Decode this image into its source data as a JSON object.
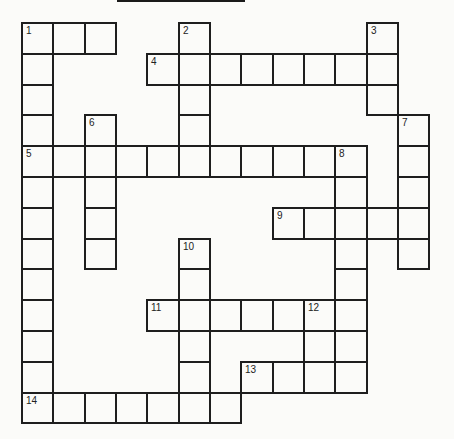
{
  "puzzle": {
    "title_bar": true,
    "grid": {
      "origin_x": 21,
      "origin_y": 22,
      "cell_w": 31.33,
      "cell_h": 30.8,
      "cols": 13,
      "rows": 13,
      "line_color": "#1e1e1e",
      "background": "#fbfbf9"
    },
    "entries": [
      {
        "number": 1,
        "direction": "across",
        "row": 0,
        "col": 0,
        "length": 3
      },
      {
        "number": 1,
        "direction": "down",
        "row": 0,
        "col": 0,
        "length": 12
      },
      {
        "number": 2,
        "direction": "down",
        "row": 0,
        "col": 5,
        "length": 5
      },
      {
        "number": 3,
        "direction": "down",
        "row": 0,
        "col": 11,
        "length": 3
      },
      {
        "number": 4,
        "direction": "across",
        "row": 1,
        "col": 4,
        "length": 8
      },
      {
        "number": 5,
        "direction": "across",
        "row": 4,
        "col": 0,
        "length": 11
      },
      {
        "number": 6,
        "direction": "down",
        "row": 3,
        "col": 2,
        "length": 5
      },
      {
        "number": 7,
        "direction": "down",
        "row": 3,
        "col": 12,
        "length": 5
      },
      {
        "number": 8,
        "direction": "down",
        "row": 4,
        "col": 10,
        "length": 7
      },
      {
        "number": 9,
        "direction": "across",
        "row": 6,
        "col": 8,
        "length": 5
      },
      {
        "number": 10,
        "direction": "down",
        "row": 7,
        "col": 5,
        "length": 6
      },
      {
        "number": 11,
        "direction": "across",
        "row": 9,
        "col": 4,
        "length": 7
      },
      {
        "number": 12,
        "direction": "down",
        "row": 9,
        "col": 9,
        "length": 3
      },
      {
        "number": 13,
        "direction": "across",
        "row": 11,
        "col": 7,
        "length": 4
      },
      {
        "number": 14,
        "direction": "across",
        "row": 12,
        "col": 0,
        "length": 7
      }
    ],
    "numbers": [
      {
        "label": "1",
        "row": 0,
        "col": 0
      },
      {
        "label": "2",
        "row": 0,
        "col": 5
      },
      {
        "label": "3",
        "row": 0,
        "col": 11
      },
      {
        "label": "4",
        "row": 1,
        "col": 4
      },
      {
        "label": "5",
        "row": 4,
        "col": 0
      },
      {
        "label": "6",
        "row": 3,
        "col": 2
      },
      {
        "label": "7",
        "row": 3,
        "col": 12
      },
      {
        "label": "8",
        "row": 4,
        "col": 10
      },
      {
        "label": "9",
        "row": 6,
        "col": 8
      },
      {
        "label": "10",
        "row": 7,
        "col": 5
      },
      {
        "label": "11",
        "row": 9,
        "col": 4
      },
      {
        "label": "12",
        "row": 9,
        "col": 9
      },
      {
        "label": "13",
        "row": 11,
        "col": 7
      },
      {
        "label": "14",
        "row": 12,
        "col": 0
      }
    ]
  }
}
